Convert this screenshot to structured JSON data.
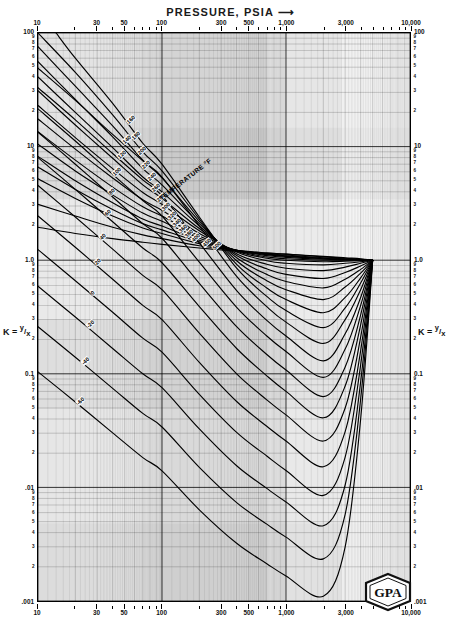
{
  "chart_title": "PRESSURE, PSIA",
  "chart_title_arrow": "⟶",
  "axis": {
    "x_label": "PRESSURE, PSIA",
    "x_min": 10,
    "x_max": 10000,
    "x_scale": "log",
    "x_major_ticks": [
      "10",
      "30",
      "50",
      "100",
      "300",
      "500",
      "1,000",
      "3,000",
      "10,000"
    ],
    "x_major_values": [
      10,
      30,
      50,
      100,
      300,
      500,
      1000,
      3000,
      10000
    ],
    "x_minor_values": [
      20,
      40,
      60,
      70,
      80,
      90,
      200,
      400,
      600,
      700,
      800,
      900,
      2000,
      4000,
      5000,
      6000,
      7000,
      8000,
      9000
    ],
    "y_label_left": "K = y/x",
    "y_label_right": "K = y/x",
    "y_min": 0.001,
    "y_max": 100,
    "y_scale": "log",
    "y_major_ticks": [
      "100",
      "10",
      "1.0",
      "0.1",
      ".01",
      ".001"
    ],
    "y_major_values": [
      100,
      10,
      1.0,
      0.1,
      0.01,
      0.001
    ],
    "y_minor_digits": [
      "9",
      "8",
      "7",
      "6",
      "5",
      "4",
      "3",
      "2"
    ],
    "grid": true
  },
  "k_numerator": "y",
  "k_denominator": "x",
  "k_equals": "K =",
  "temperature_header": "TEMPERATURE °F",
  "logo": {
    "text": "GPA",
    "name": "gpa-logo"
  },
  "chart_data": {
    "type": "line",
    "title": "PRESSURE, PSIA",
    "xlabel": "PRESSURE, PSIA",
    "ylabel": "K = y/x",
    "xlim": [
      10,
      10000
    ],
    "ylim": [
      0.001,
      100
    ],
    "xscale": "log",
    "yscale": "log",
    "grid": true,
    "legend": "inline-curve-labels",
    "legend_title": "TEMPERATURE °F",
    "convergence_pressure_psia": 5000,
    "convergence_k": 1.0,
    "series": [
      {
        "name": "500",
        "label": "500",
        "x": [
          10,
          20,
          40,
          70,
          100,
          200,
          400,
          700,
          1000,
          2000,
          3000,
          4000,
          5000
        ],
        "y": [
          1.95,
          1.72,
          1.55,
          1.44,
          1.38,
          1.28,
          1.2,
          1.15,
          1.13,
          1.08,
          1.05,
          1.03,
          1.0
        ]
      },
      {
        "name": "450",
        "label": "450",
        "x": [
          10,
          20,
          40,
          70,
          100,
          200,
          400,
          700,
          1000,
          2000,
          3000,
          4000,
          5000
        ],
        "y": [
          3.1,
          2.45,
          1.95,
          1.67,
          1.55,
          1.34,
          1.22,
          1.16,
          1.13,
          1.07,
          1.04,
          1.02,
          1.0
        ]
      },
      {
        "name": "400",
        "label": "400",
        "x": [
          10,
          20,
          40,
          70,
          100,
          200,
          400,
          700,
          1000,
          2000,
          3000,
          4000,
          5000
        ],
        "y": [
          5.2,
          3.5,
          2.45,
          1.92,
          1.72,
          1.4,
          1.22,
          1.14,
          1.11,
          1.05,
          1.03,
          1.015,
          1.0
        ]
      },
      {
        "name": "380",
        "label": "380",
        "x": [
          10,
          20,
          40,
          70,
          100,
          200,
          400,
          700,
          1000,
          2000,
          3000,
          4000,
          5000
        ],
        "y": [
          6.6,
          4.2,
          2.8,
          2.1,
          1.85,
          1.45,
          1.22,
          1.13,
          1.09,
          1.04,
          1.02,
          1.01,
          1.0
        ]
      },
      {
        "name": "360",
        "label": "360",
        "x": [
          10,
          20,
          40,
          70,
          100,
          200,
          400,
          700,
          1000,
          2000,
          3000,
          4000,
          5000
        ],
        "y": [
          8.2,
          5.0,
          3.2,
          2.3,
          2.0,
          1.5,
          1.22,
          1.12,
          1.08,
          1.03,
          1.015,
          1.008,
          1.0
        ]
      },
      {
        "name": "340",
        "label": "340",
        "x": [
          10,
          20,
          40,
          70,
          100,
          200,
          400,
          700,
          1000,
          2000,
          3000,
          4000,
          5000
        ],
        "y": [
          10.5,
          6.1,
          3.75,
          2.6,
          2.2,
          1.56,
          1.22,
          1.1,
          1.06,
          1.02,
          1.01,
          1.005,
          1.0
        ]
      },
      {
        "name": "320",
        "label": "320",
        "x": [
          10,
          20,
          40,
          70,
          100,
          200,
          400,
          700,
          1000,
          2000,
          3000,
          4000,
          5000
        ],
        "y": [
          13.5,
          7.6,
          4.4,
          2.95,
          2.45,
          1.63,
          1.21,
          1.07,
          1.03,
          1.0,
          1.0,
          1.0,
          1.0
        ]
      },
      {
        "name": "300",
        "label": "300",
        "x": [
          10,
          20,
          40,
          70,
          100,
          200,
          400,
          700,
          1000,
          2000,
          3000,
          4000,
          5000
        ],
        "y": [
          17.5,
          9.5,
          5.3,
          3.4,
          2.75,
          1.72,
          1.2,
          1.04,
          1.0,
          0.97,
          0.98,
          0.99,
          1.0
        ]
      },
      {
        "name": "280",
        "label": "280",
        "x": [
          10,
          20,
          40,
          70,
          100,
          200,
          400,
          700,
          1000,
          2000,
          3000,
          4000,
          5000
        ],
        "y": [
          23,
          12,
          6.4,
          3.95,
          3.1,
          1.82,
          1.18,
          0.99,
          0.94,
          0.91,
          0.94,
          0.97,
          1.0
        ]
      },
      {
        "name": "260",
        "label": "260",
        "x": [
          10,
          20,
          40,
          70,
          100,
          200,
          400,
          700,
          1000,
          2000,
          3000,
          4000,
          5000
        ],
        "y": [
          31,
          15.5,
          7.9,
          4.6,
          3.5,
          1.9,
          1.14,
          0.92,
          0.85,
          0.81,
          0.87,
          0.94,
          1.0
        ]
      },
      {
        "name": "240",
        "label": "240",
        "x": [
          10,
          20,
          40,
          70,
          100,
          200,
          400,
          700,
          1000,
          2000,
          3000,
          4000,
          5000
        ],
        "y": [
          41,
          20,
          9.8,
          5.4,
          4.0,
          2.0,
          1.1,
          0.84,
          0.75,
          0.69,
          0.78,
          0.89,
          1.0
        ]
      },
      {
        "name": "220",
        "label": "220",
        "x": [
          10,
          20,
          40,
          70,
          100,
          200,
          400,
          700,
          1000,
          2000,
          3000,
          4000,
          5000
        ],
        "y": [
          56,
          26,
          12.2,
          6.4,
          4.6,
          2.1,
          1.05,
          0.75,
          0.65,
          0.57,
          0.68,
          0.83,
          1.0
        ]
      },
      {
        "name": "200",
        "label": "200",
        "x": [
          10,
          20,
          40,
          70,
          100,
          200,
          400,
          700,
          1000,
          2000,
          3000,
          4000,
          5000
        ],
        "y": [
          76,
          34,
          15.2,
          7.6,
          5.3,
          2.2,
          0.99,
          0.66,
          0.55,
          0.45,
          0.58,
          0.77,
          1.0
        ]
      },
      {
        "name": "180",
        "label": "180",
        "x": [
          10,
          20,
          40,
          70,
          100,
          200,
          400,
          700,
          1000,
          2000,
          3000,
          4000,
          5000
        ],
        "y": [
          100,
          45,
          19,
          9.0,
          6.1,
          2.3,
          0.92,
          0.57,
          0.45,
          0.345,
          0.47,
          0.7,
          1.0
        ]
      },
      {
        "name": "160",
        "label": "160",
        "x": [
          14,
          20,
          40,
          70,
          100,
          200,
          400,
          700,
          1000,
          2000,
          3000,
          4000,
          5000
        ],
        "y": [
          100,
          60,
          24,
          10.7,
          7.0,
          2.4,
          0.85,
          0.48,
          0.36,
          0.255,
          0.38,
          0.63,
          1.0
        ]
      },
      {
        "name": "140",
        "label": "140",
        "x": [
          10,
          20,
          40,
          70,
          100,
          200,
          400,
          700,
          1000,
          2000,
          3000,
          4000,
          5000
        ],
        "y": [
          49,
          25.5,
          12.8,
          7.5,
          5.4,
          2.0,
          0.72,
          0.39,
          0.285,
          0.185,
          0.3,
          0.55,
          1.0
        ]
      },
      {
        "name": "120",
        "label": "120",
        "x": [
          10,
          20,
          40,
          70,
          100,
          200,
          400,
          700,
          1000,
          2000,
          3000,
          4000,
          5000
        ],
        "y": [
          33,
          17.2,
          8.7,
          5.1,
          3.7,
          1.42,
          0.54,
          0.295,
          0.215,
          0.13,
          0.225,
          0.47,
          1.0
        ]
      },
      {
        "name": "100",
        "label": "100",
        "x": [
          10,
          20,
          40,
          70,
          100,
          200,
          400,
          700,
          1000,
          2000,
          3000,
          4000,
          5000
        ],
        "y": [
          21.5,
          11.2,
          5.7,
          3.35,
          2.45,
          0.96,
          0.385,
          0.215,
          0.157,
          0.093,
          0.165,
          0.4,
          1.0
        ]
      },
      {
        "name": "80",
        "label": "80",
        "x": [
          10,
          20,
          40,
          70,
          100,
          200,
          400,
          700,
          1000,
          2000,
          3000,
          4000,
          5000
        ],
        "y": [
          13.4,
          7.0,
          3.6,
          2.1,
          1.56,
          0.625,
          0.26,
          0.148,
          0.108,
          0.063,
          0.115,
          0.33,
          1.0
        ]
      },
      {
        "name": "60",
        "label": "60",
        "x": [
          10,
          20,
          40,
          70,
          100,
          200,
          400,
          700,
          1000,
          2000,
          3000,
          4000,
          5000
        ],
        "y": [
          8.0,
          4.2,
          2.18,
          1.28,
          0.95,
          0.39,
          0.167,
          0.096,
          0.07,
          0.041,
          0.078,
          0.27,
          1.0
        ]
      },
      {
        "name": "40",
        "label": "40",
        "x": [
          10,
          20,
          40,
          70,
          100,
          200,
          400,
          700,
          1000,
          2000,
          3000,
          4000,
          5000
        ],
        "y": [
          4.55,
          2.4,
          1.25,
          0.735,
          0.55,
          0.228,
          0.1,
          0.059,
          0.0435,
          0.0256,
          0.05,
          0.21,
          1.0
        ]
      },
      {
        "name": "20",
        "label": "20",
        "x": [
          10,
          20,
          40,
          70,
          100,
          200,
          400,
          700,
          1000,
          2000,
          3000,
          4000,
          5000
        ],
        "y": [
          2.45,
          1.3,
          0.68,
          0.4,
          0.3,
          0.126,
          0.057,
          0.0345,
          0.0256,
          0.0152,
          0.031,
          0.16,
          1.0
        ]
      },
      {
        "name": "0",
        "label": "0",
        "x": [
          10,
          20,
          40,
          70,
          100,
          200,
          400,
          700,
          1000,
          2000,
          3000,
          4000,
          5000
        ],
        "y": [
          1.24,
          0.66,
          0.348,
          0.206,
          0.155,
          0.066,
          0.0305,
          0.0189,
          0.0141,
          0.0085,
          0.0185,
          0.12,
          1.0
        ]
      },
      {
        "name": "-20",
        "label": "-20",
        "x": [
          10,
          20,
          40,
          70,
          100,
          200,
          400,
          700,
          1000,
          2000,
          3000,
          4000,
          5000
        ],
        "y": [
          0.59,
          0.316,
          0.167,
          0.1,
          0.0755,
          0.0327,
          0.0155,
          0.0098,
          0.00745,
          0.0046,
          0.0105,
          0.085,
          1.0
        ]
      },
      {
        "name": "-40",
        "label": "-40",
        "x": [
          10,
          20,
          40,
          70,
          100,
          200,
          400,
          700,
          1000,
          2000,
          3000,
          4000,
          5000
        ],
        "y": [
          0.26,
          0.14,
          0.0745,
          0.0448,
          0.034,
          0.015,
          0.00735,
          0.00475,
          0.00365,
          0.00235,
          0.0058,
          0.06,
          1.0
        ]
      },
      {
        "name": "-60",
        "label": "-60",
        "x": [
          10,
          20,
          40,
          70,
          100,
          200,
          400,
          700,
          1000,
          2000,
          3000,
          4000,
          5000
        ],
        "y": [
          0.104,
          0.0565,
          0.0302,
          0.0183,
          0.014,
          0.00635,
          0.00322,
          0.00213,
          0.00166,
          0.0011,
          0.003,
          0.04,
          1.0
        ]
      }
    ]
  }
}
